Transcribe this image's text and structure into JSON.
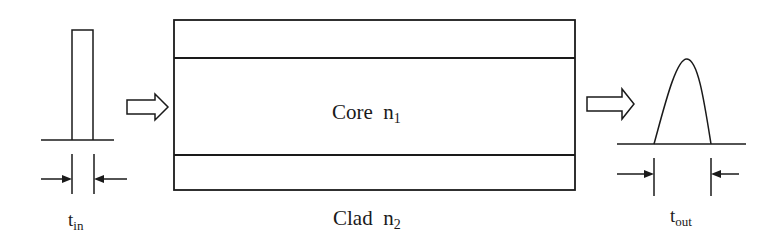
{
  "diagram": {
    "input_pulse": {
      "label_main": "t",
      "label_sub": "in",
      "shape": "rectangular"
    },
    "fiber": {
      "core_label": "Core  n",
      "core_sub": "1",
      "clad_label": "Clad  n",
      "clad_sub": "2"
    },
    "output_pulse": {
      "label_main": "t",
      "label_sub": "out",
      "shape": "broadened"
    },
    "arrows": [
      "input-to-fiber-arrow",
      "fiber-to-output-arrow"
    ],
    "colors": {
      "stroke": "#1a1a1a",
      "background": "#ffffff"
    }
  }
}
